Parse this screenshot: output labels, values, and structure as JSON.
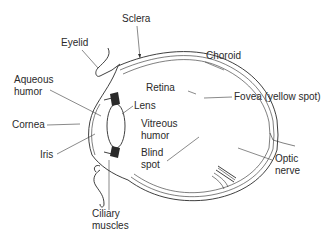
{
  "diagram": {
    "colors": {
      "ink": "#2a2a2a",
      "background": "#ffffff"
    },
    "labels": {
      "sclera": "Sclera",
      "eyelid": "Eyelid",
      "choroid": "Choroid",
      "aqueous_1": "Aqueous",
      "aqueous_2": "humor",
      "retina": "Retina",
      "lens": "Lens",
      "fovea": "Fovea (yellow spot)",
      "cornea": "Cornea",
      "vitreous_1": "Vitreous",
      "vitreous_2": "humor",
      "iris": "Iris",
      "blind_1": "Blind",
      "blind_2": "spot",
      "optic_1": "Optic",
      "optic_2": "nerve",
      "ciliary_1": "Ciliary",
      "ciliary_2": "muscles"
    }
  }
}
